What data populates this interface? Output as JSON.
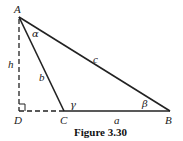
{
  "figure": {
    "caption": "Figure 3.30",
    "vertices": {
      "A": {
        "label": "A"
      },
      "B": {
        "label": "B"
      },
      "C": {
        "label": "C"
      },
      "D": {
        "label": "D"
      }
    },
    "sides": {
      "a": "a",
      "b": "b",
      "c": "c",
      "h": "h"
    },
    "angles": {
      "alpha": "α",
      "beta": "β",
      "gamma": "γ"
    }
  }
}
